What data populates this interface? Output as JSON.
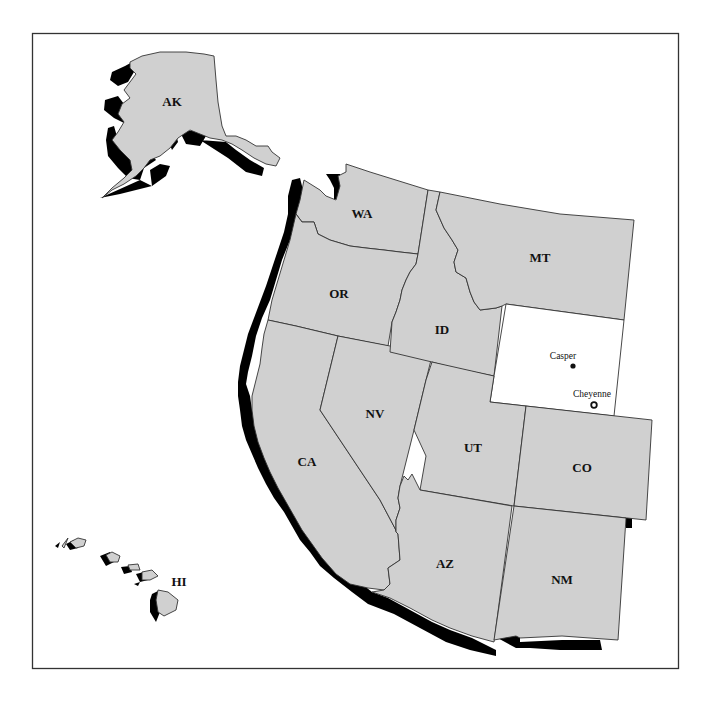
{
  "map": {
    "title": "",
    "colors": {
      "state_fill": "#d0d0d0",
      "highlight_fill": "#ffffff",
      "shadow": "#000000",
      "border": "#333333"
    },
    "highlighted_state": "WY",
    "states": [
      {
        "abbr": "AK",
        "label": "AK"
      },
      {
        "abbr": "HI",
        "label": "HI"
      },
      {
        "abbr": "WA",
        "label": "WA"
      },
      {
        "abbr": "OR",
        "label": "OR"
      },
      {
        "abbr": "CA",
        "label": "CA"
      },
      {
        "abbr": "NV",
        "label": "NV"
      },
      {
        "abbr": "ID",
        "label": "ID"
      },
      {
        "abbr": "MT",
        "label": "MT"
      },
      {
        "abbr": "WY",
        "label": ""
      },
      {
        "abbr": "UT",
        "label": "UT"
      },
      {
        "abbr": "CO",
        "label": "CO"
      },
      {
        "abbr": "AZ",
        "label": "AZ"
      },
      {
        "abbr": "NM",
        "label": "NM"
      }
    ],
    "cities": [
      {
        "name": "Casper",
        "type": "city",
        "icon": "dot-icon"
      },
      {
        "name": "Cheyenne",
        "type": "capital",
        "icon": "star-in-circle-icon"
      }
    ]
  }
}
